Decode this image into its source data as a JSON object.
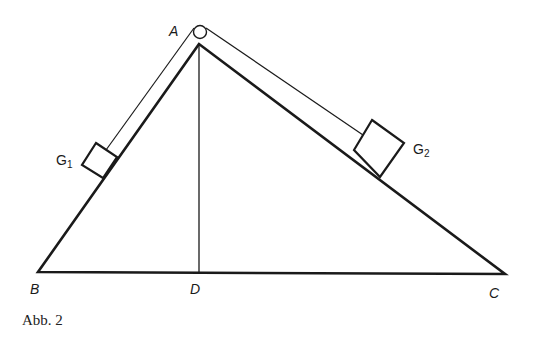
{
  "figure": {
    "caption": "Abb. 2",
    "points": {
      "A": {
        "label": "A"
      },
      "B": {
        "label": "B"
      },
      "C": {
        "label": "C"
      },
      "D": {
        "label": "D"
      }
    },
    "weights": {
      "G1": {
        "letter": "G",
        "sub": "1"
      },
      "G2": {
        "letter": "G",
        "sub": "2"
      }
    },
    "colors": {
      "stroke": "#1a1a1a",
      "background": "#ffffff"
    }
  }
}
